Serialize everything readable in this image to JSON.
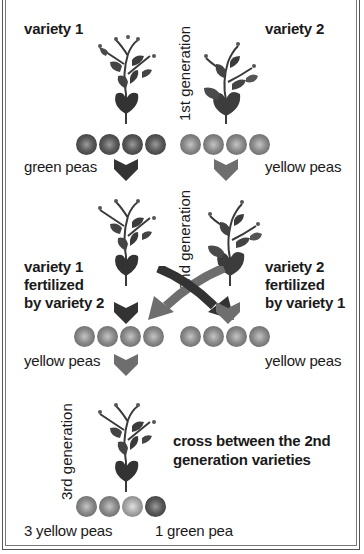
{
  "diagram": {
    "title_fragment": "",
    "gen1": {
      "generation_label": "1st generation",
      "left_variety": "variety 1",
      "right_variety": "variety 2",
      "left_peas_label": "green peas",
      "right_peas_label": "yellow peas",
      "left_peas": [
        "green",
        "green",
        "green",
        "green"
      ],
      "right_peas": [
        "yellow",
        "yellow",
        "yellow",
        "yellow"
      ]
    },
    "gen2": {
      "generation_label": "2nd generation",
      "left_label": [
        "variety 1",
        "fertilized",
        "by variety 2"
      ],
      "right_label": [
        "variety 2",
        "fertilized",
        "by variety 1"
      ],
      "left_peas_label": "yellow peas",
      "right_peas_label": "yellow peas",
      "left_peas": [
        "yellow",
        "yellow",
        "yellow",
        "yellow"
      ],
      "right_peas": [
        "yellow",
        "yellow",
        "yellow",
        "yellow"
      ]
    },
    "gen3": {
      "generation_label": "3rd generation",
      "description": [
        "cross between the 2nd",
        "generation varieties"
      ],
      "yellow_label": "3 yellow peas",
      "green_label": "1 green pea",
      "peas": [
        "yellow",
        "yellow",
        "yellow",
        "green"
      ]
    },
    "colors": {
      "border": "#555555",
      "text": "#1a1a1a",
      "dark_arrow": "#333333",
      "light_arrow": "#6e6e6e",
      "plant_dark": "#2f2f2f",
      "plant_mid": "#555555"
    }
  }
}
